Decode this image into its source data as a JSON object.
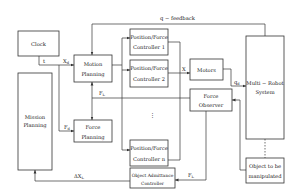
{
  "diagram": {
    "colors": {
      "line": "#333333",
      "text": "#222222",
      "background": "#ffffff"
    },
    "blocks": {
      "clock": {
        "label": "Clock"
      },
      "mission_planning": {
        "line1": "Mission",
        "line2": "Planning"
      },
      "motion_planning": {
        "line1": "Motion",
        "line2": "Planning"
      },
      "force_planning": {
        "line1": "Force",
        "line2": "Planning"
      },
      "controller_1": {
        "line1": "Position/Force",
        "line2": "Controller 1"
      },
      "controller_2": {
        "line1": "Position/Force",
        "line2": "Controller 2"
      },
      "controller_n": {
        "line1": "Position/Force",
        "line2": "Controller n"
      },
      "motors": {
        "label": "Motors"
      },
      "force_observer": {
        "line1": "Force",
        "line2": "Observer"
      },
      "multi_robot_system": {
        "line1": "Multi − Robot",
        "line2": "System"
      },
      "object": {
        "line1": "Object to be",
        "line2": "manipulated"
      },
      "object_admittance": {
        "line1": "Object Admittance",
        "line2": "Controller"
      }
    },
    "signals": {
      "t": "t",
      "xd_main": "X",
      "xd_sub": "d",
      "fd_main": "F",
      "fd_sub": "d",
      "fl_top_main": "F",
      "fl_top_sub": "L",
      "x": "X",
      "qd_main": "q",
      "qd_sub": "d",
      "feedback": "q − feedback",
      "dxl_main": "ΔX",
      "dxl_sub": "L",
      "fl_bottom_main": "F",
      "fl_bottom_sub": "L",
      "ellipsis": "⋮"
    }
  }
}
